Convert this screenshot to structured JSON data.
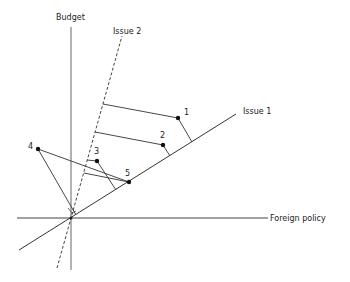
{
  "axes": {
    "y_label": "Budget",
    "x_label": "Foreign policy",
    "issue1_label": "Issue 1",
    "issue2_label": "Issue 2"
  },
  "points": [
    {
      "label": "1",
      "x": 178,
      "y": 118
    },
    {
      "label": "2",
      "x": 163,
      "y": 145
    },
    {
      "label": "3",
      "x": 97,
      "y": 161
    },
    {
      "label": "4",
      "x": 38,
      "y": 149
    },
    {
      "label": "5",
      "x": 129,
      "y": 182
    }
  ],
  "colors": {
    "ink": "#222222",
    "axis": "#555555"
  }
}
